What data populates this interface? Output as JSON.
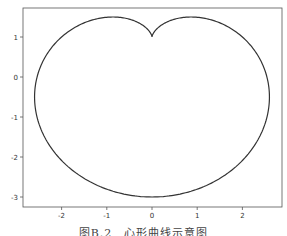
{
  "caption": "图B.2　心形曲线示意图",
  "chart_data": {
    "type": "line",
    "title": "",
    "xlabel": "",
    "ylabel": "",
    "xlim": [
      -2.85,
      2.85
    ],
    "ylim": [
      -3.25,
      1.7
    ],
    "x_ticks": [
      -2,
      -1,
      0,
      1,
      2
    ],
    "y_ticks": [
      1,
      0,
      -1,
      -2,
      -3
    ],
    "x_tick_labels": [
      "-2",
      "-1",
      "0",
      "1",
      "2"
    ],
    "y_tick_labels": [
      "1",
      "0",
      "-1",
      "-2",
      "-3"
    ],
    "grid": false,
    "legend": null,
    "series": [
      {
        "name": "cardioid",
        "equation": "x = 2(1 - sin t) cos t, y = 2(1 - sin t) sin t + 1",
        "color": "#333333",
        "key_points": {
          "cusp": [
            0,
            1
          ],
          "bottom": [
            0,
            -3
          ],
          "left_lobe_top": [
            -0.87,
            1.5
          ],
          "right_lobe_top": [
            0.87,
            1.5
          ],
          "leftmost": [
            -2.6,
            -0.5
          ],
          "rightmost": [
            2.6,
            -0.5
          ]
        }
      }
    ]
  }
}
